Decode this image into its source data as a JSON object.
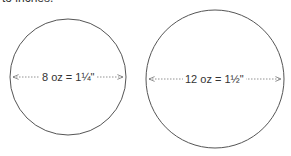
{
  "header": {
    "clipped_text": "to inches."
  },
  "circles": [
    {
      "label": "8 oz = 1¼\"",
      "cx": 68,
      "cy": 77,
      "r": 58
    },
    {
      "label": "12 oz = 1½\"",
      "cx": 215,
      "cy": 79,
      "r": 69
    }
  ],
  "colors": {
    "stroke": "#555555",
    "text": "#333333"
  }
}
